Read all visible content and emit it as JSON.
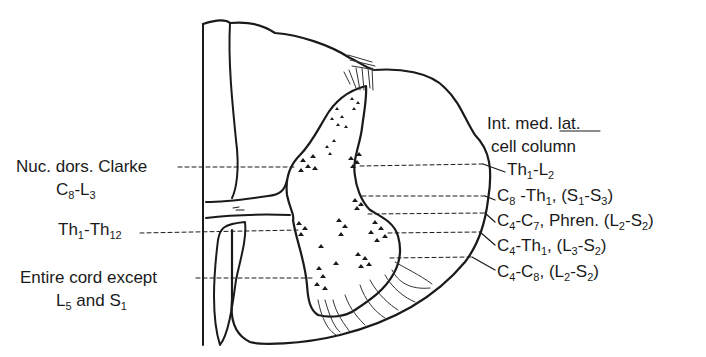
{
  "diagram": {
    "type": "spinal-cord-cross-section",
    "stroke_color": "#1a1a1a",
    "left_labels": [
      {
        "id": "nuc-dors-clarke",
        "line1": "Nuc. dors. Clarke",
        "line2_parts": [
          [
            "C",
            "8"
          ],
          [
            "-L",
            "3"
          ]
        ]
      },
      {
        "id": "thoracic",
        "parts": [
          [
            "Th",
            "1"
          ],
          [
            "-Th",
            "12"
          ]
        ]
      },
      {
        "id": "entire-cord",
        "line1": "Entire cord except",
        "line2_parts": [
          [
            "L",
            "5"
          ],
          [
            " and S",
            "1"
          ]
        ]
      }
    ],
    "right_header": {
      "line1": "Int. med. lat.",
      "line2": "cell column"
    },
    "right_labels": [
      {
        "id": "imlc",
        "parts": [
          [
            "Th",
            "1"
          ],
          [
            "-L",
            "2"
          ]
        ]
      },
      {
        "id": "col-2",
        "parts": [
          [
            "C",
            "8"
          ],
          [
            " -Th",
            "1"
          ],
          [
            ", (S",
            "1"
          ],
          [
            "-S",
            "3"
          ],
          [
            ")",
            ""
          ]
        ]
      },
      {
        "id": "col-3",
        "parts": [
          [
            "C",
            "4"
          ],
          [
            "-C",
            "7"
          ],
          [
            ", Phren. (L",
            "2"
          ],
          [
            "-S",
            "2"
          ],
          [
            ")",
            ""
          ]
        ]
      },
      {
        "id": "col-4",
        "parts": [
          [
            "C",
            "4"
          ],
          [
            "-Th",
            "1"
          ],
          [
            ", (L",
            "3"
          ],
          [
            "-S",
            "2"
          ],
          [
            ")",
            ""
          ]
        ]
      },
      {
        "id": "col-5",
        "parts": [
          [
            "C",
            "4"
          ],
          [
            "-C",
            "8"
          ],
          [
            ", (L",
            "2"
          ],
          [
            "-S",
            "2"
          ],
          [
            ")",
            ""
          ]
        ]
      }
    ]
  },
  "text": {
    "nuc_l1": "Nuc. dors. Clarke",
    "nuc_l2_a": "C",
    "nuc_l2_a_sub": "8",
    "nuc_l2_b": "-L",
    "nuc_l2_b_sub": "3",
    "th_a": "Th",
    "th_a_sub": "1",
    "th_b": "-Th",
    "th_b_sub": "12",
    "entire_l1": "Entire cord except",
    "entire_l2_a": "L",
    "entire_l2_a_sub": "5",
    "entire_l2_b": " and S",
    "entire_l2_b_sub": "1",
    "iml_l1": "Int. med. lat.",
    "iml_l2": "cell column",
    "r1_a": "Th",
    "r1_a_sub": "1",
    "r1_b": "-L",
    "r1_b_sub": "2",
    "r2_a": "C",
    "r2_a_sub": "8",
    "r2_b": " -Th",
    "r2_b_sub": "1",
    "r2_c": ", (S",
    "r2_c_sub": "1",
    "r2_d": "-S",
    "r2_d_sub": "3",
    "r2_e": ")",
    "r3_a": "C",
    "r3_a_sub": "4",
    "r3_b": "-C",
    "r3_b_sub": "7",
    "r3_c": ", Phren. (L",
    "r3_c_sub": "2",
    "r3_d": "-S",
    "r3_d_sub": "2",
    "r3_e": ")",
    "r4_a": "C",
    "r4_a_sub": "4",
    "r4_b": "-Th",
    "r4_b_sub": "1",
    "r4_c": ", (L",
    "r4_c_sub": "3",
    "r4_d": "-S",
    "r4_d_sub": "2",
    "r4_e": ")",
    "r5_a": "C",
    "r5_a_sub": "4",
    "r5_b": "-C",
    "r5_b_sub": "8",
    "r5_c": ", (L",
    "r5_c_sub": "2",
    "r5_d": "-S",
    "r5_d_sub": "2",
    "r5_e": ")"
  }
}
